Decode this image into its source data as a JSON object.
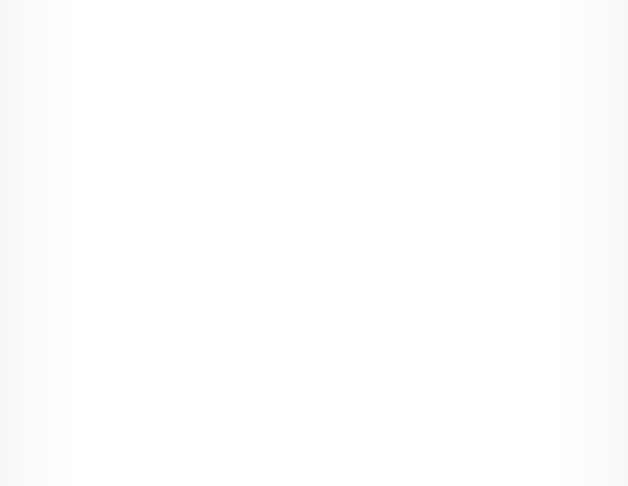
{
  "figure": {
    "type": "electrical-circuit-schematic",
    "background_color": "#ffffff",
    "line_color": "#2a2a2a",
    "border": {
      "name": "outer-frame",
      "x": 22,
      "y": 17,
      "width": 585,
      "height": 448,
      "style": "solid"
    },
    "dashed_group": {
      "name": "network-boundary",
      "label": "C",
      "x": 87,
      "y": 42,
      "width": 330,
      "height": 390,
      "style": "dashed",
      "leader_line": {
        "from_x": 414,
        "from_y": 89,
        "to_x": 448,
        "to_y": 66
      },
      "label_x": 453,
      "label_y": 52
    },
    "components": [
      {
        "id": "resistor-a",
        "label_base": "R",
        "label_sub": "A",
        "label_x": 230,
        "label_y": 56,
        "box": {
          "x": 201,
          "y": 85,
          "width": 102,
          "height": 65
        },
        "lead_y": 118,
        "inside_group": true
      },
      {
        "id": "resistor-3",
        "label_base": "R",
        "label_sub": "3",
        "label_x": 233,
        "label_y": 177,
        "box": {
          "x": 201,
          "y": 212,
          "width": 102,
          "height": 64
        },
        "lead_y": 240,
        "inside_group": true
      },
      {
        "id": "resistor-b",
        "label_base": "R",
        "label_sub": "B",
        "label_x": 230,
        "label_y": 297,
        "box": {
          "x": 201,
          "y": 331,
          "width": 102,
          "height": 64
        },
        "lead_y": 363,
        "inside_group": true
      },
      {
        "id": "resistor-7",
        "label_base": "R",
        "label_sub": "7",
        "label_x": 477,
        "label_y": 167,
        "box": {
          "x": 445,
          "y": 205,
          "width": 100,
          "height": 65
        },
        "lead_y": 240,
        "inside_group": false
      }
    ],
    "wires": {
      "left_terminal_x": 52,
      "right_terminal_x": 575,
      "main_line_y": 240,
      "left_bus_x": 140,
      "right_bus_x": 364,
      "top_branch_y": 118,
      "bottom_branch_y": 363
    }
  }
}
